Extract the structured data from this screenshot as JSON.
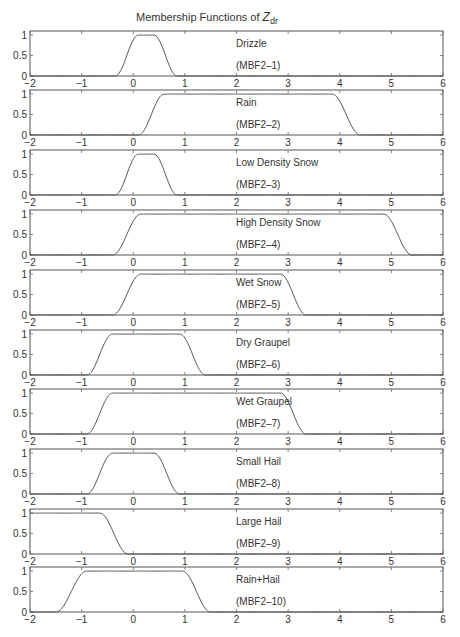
{
  "chart_data": {
    "type": "line",
    "title_main": "Membership Functions of ",
    "title_var": "Z",
    "title_sub": "dr",
    "xlabel": "",
    "ylabel": "",
    "xlim": [
      -2,
      6
    ],
    "ylim": [
      0,
      1.1
    ],
    "x_ticks": [
      -2,
      -1,
      0,
      1,
      2,
      3,
      4,
      5,
      6
    ],
    "y_ticks": [
      0,
      0.5,
      1
    ],
    "y_tick_labels": [
      "0",
      "0.5",
      "1"
    ],
    "x_tick_labels": [
      "−2",
      "−1",
      "0",
      "1",
      "2",
      "3",
      "4",
      "5",
      "6"
    ],
    "grid": false,
    "panels": [
      {
        "name": "Drizzle",
        "code": "(MBF2–1)",
        "shape": "two-sided",
        "rise_start": -0.35,
        "rise_end": 0.1,
        "fall_start": 0.4,
        "fall_end": 0.85
      },
      {
        "name": "Rain",
        "code": "(MBF2–2)",
        "shape": "two-sided",
        "rise_start": 0.1,
        "rise_end": 0.6,
        "fall_start": 3.85,
        "fall_end": 4.4
      },
      {
        "name": "Low Density Snow",
        "code": "(MBF2–3)",
        "shape": "two-sided",
        "rise_start": -0.35,
        "rise_end": 0.1,
        "fall_start": 0.4,
        "fall_end": 0.85
      },
      {
        "name": "High Density Snow",
        "code": "(MBF2–4)",
        "shape": "two-sided",
        "rise_start": -0.4,
        "rise_end": 0.15,
        "fall_start": 4.85,
        "fall_end": 5.4
      },
      {
        "name": "Wet Snow",
        "code": "(MBF2–5)",
        "shape": "two-sided",
        "rise_start": -0.4,
        "rise_end": 0.15,
        "fall_start": 2.85,
        "fall_end": 3.35
      },
      {
        "name": "Dry Graupel",
        "code": "(MBF2–6)",
        "shape": "two-sided",
        "rise_start": -0.9,
        "rise_end": -0.4,
        "fall_start": 0.9,
        "fall_end": 1.4
      },
      {
        "name": "Wet Graupel",
        "code": "(MBF2–7)",
        "shape": "two-sided",
        "rise_start": -0.9,
        "rise_end": -0.4,
        "fall_start": 2.85,
        "fall_end": 3.35
      },
      {
        "name": "Small Hail",
        "code": "(MBF2–8)",
        "shape": "two-sided",
        "rise_start": -0.9,
        "rise_end": -0.4,
        "fall_start": 0.4,
        "fall_end": 0.9
      },
      {
        "name": "Large Hail",
        "code": "(MBF2–9)",
        "shape": "left-open",
        "rise_start": -2.5,
        "rise_end": -2.2,
        "fall_start": -0.65,
        "fall_end": -0.1
      },
      {
        "name": "Rain+Hail",
        "code": "(MBF2–10)",
        "shape": "two-sided",
        "rise_start": -1.5,
        "rise_end": -0.9,
        "fall_start": 0.95,
        "fall_end": 1.5
      }
    ]
  },
  "layout": {
    "plot_left": 30,
    "plot_right": 443,
    "panel_tops": [
      31,
      90,
      150,
      210,
      270,
      330,
      389,
      449,
      509,
      567
    ],
    "panel_height": 45,
    "label_x_value": 2.0,
    "line_color": "#555555"
  }
}
